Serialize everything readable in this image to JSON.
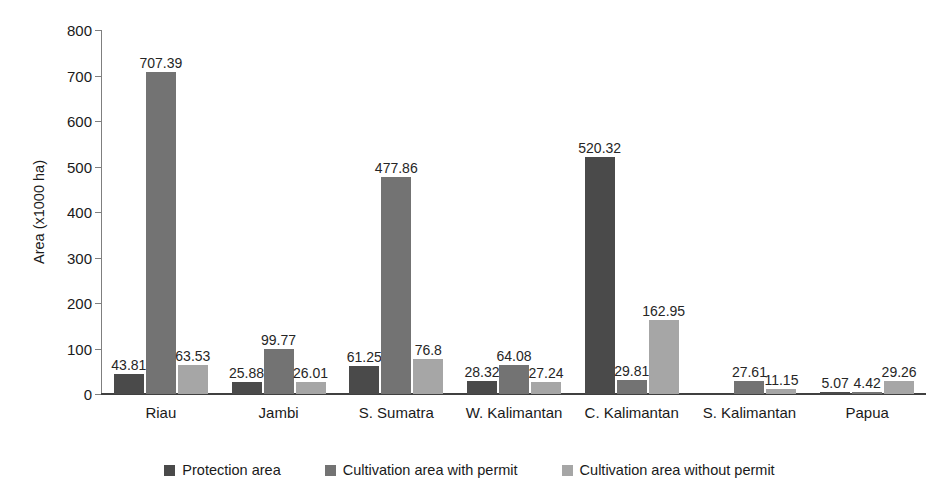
{
  "chart_data": {
    "type": "bar",
    "title": "",
    "xlabel": "",
    "ylabel": "Area (x1000 ha)",
    "ylim": [
      0,
      800
    ],
    "yticks": [
      0,
      100,
      200,
      300,
      400,
      500,
      600,
      700,
      800
    ],
    "ytick_labels": [
      "0",
      "100",
      "200",
      "300",
      "400",
      "500",
      "600",
      "700",
      "800"
    ],
    "grid": false,
    "legend_position": "bottom",
    "categories": [
      "Riau",
      "Jambi",
      "S. Sumatra",
      "W. Kalimantan",
      "C. Kalimantan",
      "S. Kalimantan",
      "Papua"
    ],
    "series": [
      {
        "name": "Protection area",
        "color": "#4a4a4a",
        "values": [
          43.81,
          25.88,
          61.25,
          28.32,
          520.32,
          0,
          5.07
        ],
        "labels": [
          "43.81",
          "25.88",
          "61.25",
          "28.32",
          "520.32",
          "",
          "5.07"
        ]
      },
      {
        "name": "Cultivation area with permit",
        "color": "#737373",
        "values": [
          707.39,
          99.77,
          477.86,
          64.08,
          29.81,
          27.61,
          4.42
        ],
        "labels": [
          "707.39",
          "99.77",
          "477.86",
          "64.08",
          "29.81",
          "27.61",
          "4.42"
        ]
      },
      {
        "name": "Cultivation area without permit",
        "color": "#a6a6a6",
        "values": [
          63.53,
          26.01,
          76.8,
          27.24,
          162.95,
          11.15,
          29.26
        ],
        "labels": [
          "63.53",
          "26.01",
          "76.8",
          "27.24",
          "162.95",
          "11.15",
          "29.26"
        ]
      }
    ]
  },
  "legend": {
    "items": [
      {
        "label": "Protection area",
        "color": "#4a4a4a"
      },
      {
        "label": "Cultivation area with permit",
        "color": "#737373"
      },
      {
        "label": "Cultivation area without permit",
        "color": "#a6a6a6"
      }
    ]
  }
}
